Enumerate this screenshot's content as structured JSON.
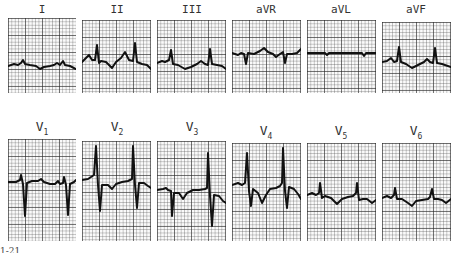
{
  "figure": {
    "type": "12-lead ECG",
    "rows": [
      {
        "leads": [
          {
            "id": "I",
            "label": "I",
            "subscript": ""
          },
          {
            "id": "II",
            "label": "II",
            "subscript": ""
          },
          {
            "id": "III",
            "label": "III",
            "subscript": ""
          },
          {
            "id": "aVR",
            "label": "aVR",
            "subscript": ""
          },
          {
            "id": "aVL",
            "label": "aVL",
            "subscript": ""
          },
          {
            "id": "aVF",
            "label": "aVF",
            "subscript": ""
          }
        ]
      },
      {
        "leads": [
          {
            "id": "V1",
            "label": "V",
            "subscript": "1"
          },
          {
            "id": "V2",
            "label": "V",
            "subscript": "2"
          },
          {
            "id": "V3",
            "label": "V",
            "subscript": "3"
          },
          {
            "id": "V4",
            "label": "V",
            "subscript": "4"
          },
          {
            "id": "V5",
            "label": "V",
            "subscript": "5"
          },
          {
            "id": "V6",
            "label": "V",
            "subscript": "6"
          }
        ]
      }
    ],
    "caption_fragment": "1-21"
  },
  "colors": {
    "grid": "#3a3a3a",
    "trace": "#111111",
    "paper": "#fafafa"
  }
}
